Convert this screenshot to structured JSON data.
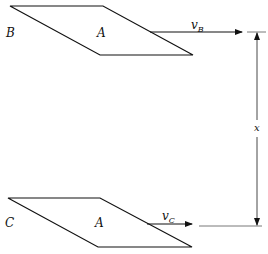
{
  "figure": {
    "plate_top": {
      "side_label": "B",
      "center_label": "A"
    },
    "plate_bottom": {
      "side_label": "C",
      "center_label": "A"
    },
    "velocity_top": {
      "symbol": "v",
      "subscript": "B"
    },
    "velocity_bottom": {
      "symbol": "v",
      "subscript": "C"
    },
    "separation": {
      "label": "x"
    },
    "colors": {
      "line": "#111111",
      "background": "#ffffff"
    }
  }
}
